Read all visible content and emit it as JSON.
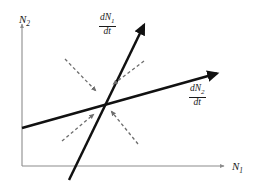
{
  "figure": {
    "name": "zero-growth-isocline-phase-plane",
    "type": "phase-plane-diagram",
    "background_color": "#ffffff",
    "width": 253,
    "height": 188
  },
  "axes": {
    "color": "#8c8c8c",
    "y_label": {
      "symbol": "N",
      "subscript": "2"
    },
    "x_label": {
      "symbol": "N",
      "subscript": "1"
    },
    "origin": {
      "x": 22,
      "y": 166
    },
    "x_end": {
      "x": 226,
      "y": 166
    },
    "y_end": {
      "x": 22,
      "y": 22
    }
  },
  "isoclines": {
    "color": "#111111",
    "items": [
      {
        "id": "dn1dt",
        "label": {
          "numerator": "dN",
          "numerator_subscript": "1",
          "denominator": "dt"
        },
        "description": "steep zero-growth isocline for species 1",
        "from": {
          "x": 69,
          "y": 180
        },
        "to": {
          "x": 145,
          "y": 22
        }
      },
      {
        "id": "dn2dt",
        "label": {
          "numerator": "dN",
          "numerator_subscript": "2",
          "denominator": "dt"
        },
        "description": "shallow zero-growth isocline for species 2",
        "from": {
          "x": 22,
          "y": 128
        },
        "to": {
          "x": 219,
          "y": 73
        }
      }
    ],
    "intersection": {
      "x": 103,
      "y": 100
    }
  },
  "vectors": {
    "color": "#6e6e6e",
    "style": "dashed",
    "direction": "inward",
    "equilibrium": "stable",
    "items": [
      {
        "id": "upper-left",
        "from": {
          "x": 65,
          "y": 59
        },
        "to": {
          "x": 97,
          "y": 92
        }
      },
      {
        "id": "upper-right",
        "from": {
          "x": 144,
          "y": 61
        },
        "to": {
          "x": 112,
          "y": 85
        }
      },
      {
        "id": "lower-left",
        "from": {
          "x": 62,
          "y": 141
        },
        "to": {
          "x": 95,
          "y": 113
        }
      },
      {
        "id": "lower-right",
        "from": {
          "x": 138,
          "y": 144
        },
        "to": {
          "x": 110,
          "y": 110
        }
      }
    ]
  }
}
